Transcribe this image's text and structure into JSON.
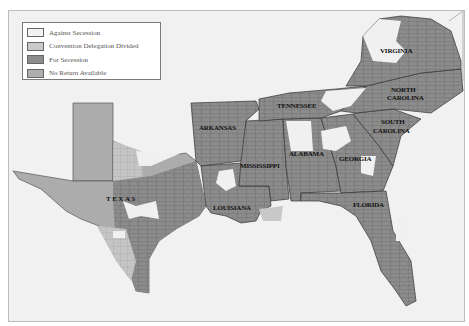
{
  "map": {
    "title": "",
    "colors": {
      "background": "#f1f1f1",
      "against": "#f0f0f0",
      "divided": "#c8c8c8",
      "for": "#8a8a8a",
      "no_return": "#acacac",
      "border": "#333333"
    },
    "legend": {
      "items": [
        {
          "label": "Against Secession",
          "color": "#f2f2f2"
        },
        {
          "label": "Convention Delegation Divided",
          "color": "#c9c9c9"
        },
        {
          "label": "For Secession",
          "color": "#8c8c8c"
        },
        {
          "label": "No Return Available",
          "color": "#aeaeae"
        }
      ]
    },
    "state_labels": {
      "virginia": "VIRGINIA",
      "north_carolina_1": "NORTH",
      "north_carolina_2": "CAROLINA",
      "south_carolina_1": "SOUTH",
      "south_carolina_2": "CAROLINA",
      "tennessee": "TENNESSEE",
      "arkansas": "ARKANSAS",
      "alabama": "ALABAMA",
      "georgia": "GEORGIA",
      "mississippi": "MISSISSIPPI",
      "texas": "TEXAS",
      "louisiana": "LOUISIANA",
      "florida": "FLORIDA"
    }
  }
}
